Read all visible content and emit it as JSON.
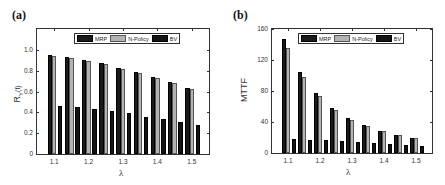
{
  "colors": {
    "mrp": "#1a1a1a",
    "n_policy": "#b3b3b3",
    "bv": "#141414"
  },
  "chart_data": [
    {
      "panel_label": "(a)",
      "type": "bar",
      "title": "",
      "xlabel": "λ",
      "ylabel": "R_Y(t)",
      "ylabel_main": "R",
      "ylabel_sub": "Y",
      "ylabel_tail": "(t)",
      "ylim": [
        0,
        1.2
      ],
      "yticks": [
        "0",
        "0.2",
        "0.4",
        "0.6",
        "0.8",
        "1.0"
      ],
      "ytick_values": [
        0,
        0.2,
        0.4,
        0.6,
        0.8,
        1.0
      ],
      "x": [
        1.1,
        1.15,
        1.2,
        1.25,
        1.3,
        1.35,
        1.4,
        1.45,
        1.5
      ],
      "xticks": [
        "1.1",
        "1.2",
        "1.3",
        "1.4",
        "1.5"
      ],
      "xtick_values": [
        1.1,
        1.2,
        1.3,
        1.4,
        1.5
      ],
      "grid": false,
      "legend_position": "top-center",
      "legend": [
        "MRP",
        "N-Policy",
        "BV"
      ],
      "series": [
        {
          "name": "MRP",
          "values": [
            0.95,
            0.93,
            0.9,
            0.87,
            0.83,
            0.79,
            0.74,
            0.69,
            0.63
          ]
        },
        {
          "name": "N-Policy",
          "values": [
            0.94,
            0.92,
            0.89,
            0.86,
            0.82,
            0.78,
            0.73,
            0.68,
            0.62
          ]
        },
        {
          "name": "BV",
          "values": [
            0.46,
            0.45,
            0.43,
            0.41,
            0.39,
            0.36,
            0.34,
            0.31,
            0.28
          ]
        }
      ]
    },
    {
      "panel_label": "(b)",
      "type": "bar",
      "title": "",
      "xlabel": "λ",
      "ylabel": "MTTF",
      "ylim": [
        0,
        160
      ],
      "yticks": [
        "0",
        "40",
        "80",
        "120",
        "160"
      ],
      "ytick_values": [
        0,
        40,
        80,
        120,
        160
      ],
      "x": [
        1.1,
        1.15,
        1.2,
        1.25,
        1.3,
        1.35,
        1.4,
        1.45,
        1.5
      ],
      "xticks": [
        "1.1",
        "1.2",
        "1.3",
        "1.4",
        "1.5"
      ],
      "xtick_values": [
        1.1,
        1.2,
        1.3,
        1.4,
        1.5
      ],
      "grid": false,
      "legend_position": "top-center",
      "legend": [
        "MRP",
        "N-Policy",
        "BV"
      ],
      "series": [
        {
          "name": "MRP",
          "values": [
            147,
            105,
            77,
            58,
            45,
            36,
            29,
            23,
            20
          ]
        },
        {
          "name": "N-Policy",
          "values": [
            135,
            98,
            73,
            55,
            43,
            35,
            28,
            23,
            19
          ]
        },
        {
          "name": "BV",
          "values": [
            18,
            17,
            17,
            16,
            14,
            13,
            12,
            10,
            9
          ]
        }
      ]
    }
  ]
}
